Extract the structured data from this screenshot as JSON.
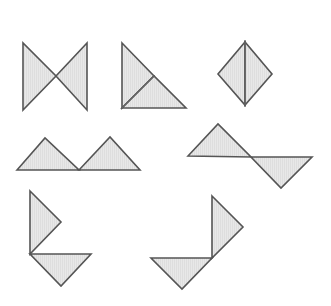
{
  "canvas": {
    "width": 331,
    "height": 306,
    "background_color": "#ffffff",
    "title": "Seven triangle tangram figures"
  },
  "style": {
    "fill_color": "#e8e8e8",
    "stroke_color": "#555555",
    "stroke_width": 1.6,
    "divider_color": "#666666",
    "divider_width": 1.3,
    "hatch_color": "#d2d2d2",
    "hatch_spacing": 2
  },
  "figures": [
    {
      "id": "figure-1",
      "name": "bowtie-two-triangles",
      "row": 1,
      "column": 1,
      "description": "Two right triangles meeting point-to-point forming a bowtie",
      "parts": [
        {
          "name": "bowtie-left-triangle",
          "points": "23,43 23,110 56,76"
        },
        {
          "name": "bowtie-right-triangle",
          "points": "87,43 87,110 56,76"
        }
      ],
      "dividers": []
    },
    {
      "id": "figure-2",
      "name": "right-triangle-split",
      "row": 1,
      "column": 2,
      "description": "Large right triangle divided into two triangles by a median line",
      "parts": [
        {
          "name": "right-triangle-upper-part",
          "points": "122,43 154,76 122,108"
        },
        {
          "name": "right-triangle-lower-part",
          "points": "122,108 154,76 186,108"
        }
      ],
      "dividers": [
        {
          "name": "median-divider",
          "x1": 122,
          "y1": 108,
          "x2": 154,
          "y2": 76
        }
      ]
    },
    {
      "id": "figure-3",
      "name": "diamond-square",
      "row": 1,
      "column": 3,
      "description": "Square rotated forty-five degrees split vertically into two triangles",
      "parts": [
        {
          "name": "diamond-left-triangle",
          "points": "245,42 245,105 218,74"
        },
        {
          "name": "diamond-right-triangle",
          "points": "245,42 245,105 272,74"
        }
      ],
      "dividers": [
        {
          "name": "vertical-divider",
          "x1": 245,
          "y1": 42,
          "x2": 245,
          "y2": 105
        }
      ]
    },
    {
      "id": "figure-4",
      "name": "double-peak-mountains",
      "row": 2,
      "column": 1,
      "description": "Two triangles side by side on a common baseline forming two peaks",
      "parts": [
        {
          "name": "peak-left-triangle",
          "points": "17,170 45,138 79,170"
        },
        {
          "name": "peak-right-triangle",
          "points": "79,170 110,137 140,170"
        }
      ],
      "dividers": []
    },
    {
      "id": "figure-5",
      "name": "zigzag-opposed-triangles",
      "row": 2,
      "column": 2,
      "description": "Upward triangle and downward triangle joined at a vertex",
      "parts": [
        {
          "name": "zigzag-upper-triangle",
          "points": "188,156 218,124 251,157"
        },
        {
          "name": "zigzag-lower-triangle",
          "points": "251,157 312,157 281,188"
        }
      ],
      "dividers": []
    },
    {
      "id": "figure-6",
      "name": "corner-arrow-left",
      "row": 3,
      "column": 1,
      "description": "Triangle pointing right above a triangle pointing down sharing a corner",
      "parts": [
        {
          "name": "corner-left-upper-triangle",
          "points": "30,191 61,222 30,254"
        },
        {
          "name": "corner-left-lower-triangle",
          "points": "30,254 91,254 61,286"
        }
      ],
      "dividers": []
    },
    {
      "id": "figure-7",
      "name": "corner-arrow-right",
      "row": 3,
      "column": 2,
      "description": "Triangle pointing right above a triangle pointing down joined at a corner",
      "parts": [
        {
          "name": "corner-right-upper-triangle",
          "points": "212,196 243,227 212,258"
        },
        {
          "name": "corner-right-lower-triangle",
          "points": "151,258 212,258 182,289"
        }
      ],
      "dividers": []
    }
  ]
}
